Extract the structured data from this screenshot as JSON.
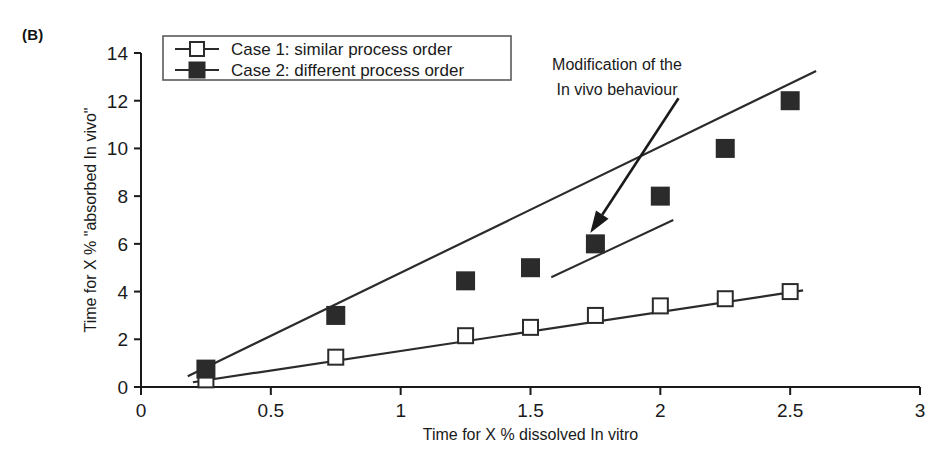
{
  "figure": {
    "panel_label": "(B)"
  },
  "chart_data": {
    "type": "line",
    "title": "",
    "subtitle": "",
    "xlabel": "Time for X % dissolved In vitro",
    "ylabel": "Time for X % \"absorbed In vivo\"",
    "xlim": [
      0,
      3
    ],
    "ylim": [
      0,
      14
    ],
    "xticks": [
      0,
      0.5,
      1,
      1.5,
      2,
      2.5,
      3
    ],
    "xtick_labels": [
      "0",
      "0.5",
      "1",
      "1.5",
      "2",
      "2.5",
      "3"
    ],
    "yticks": [
      0,
      2,
      4,
      6,
      8,
      10,
      12,
      14
    ],
    "ytick_labels": [
      "0",
      "2",
      "4",
      "6",
      "8",
      "10",
      "12",
      "14"
    ],
    "grid": false,
    "legend_position": "top-left-inside",
    "series": [
      {
        "name": "Case 1: similar process order",
        "marker": "open-square",
        "x": [
          0.25,
          0.75,
          1.25,
          1.5,
          1.75,
          2.0,
          2.25,
          2.5
        ],
        "values": [
          0.3,
          1.25,
          2.15,
          2.5,
          3.0,
          3.4,
          3.7,
          4.0
        ]
      },
      {
        "name": "Case 2: different process order",
        "marker": "filled-square",
        "x": [
          0.25,
          0.75,
          1.25,
          1.5,
          1.75,
          2.0,
          2.25,
          2.5
        ],
        "values": [
          0.75,
          3.0,
          4.45,
          5.0,
          6.0,
          8.0,
          10.0,
          12.0
        ]
      }
    ],
    "trend_lines": [
      {
        "name": "case-1-fit",
        "x": [
          0.2,
          2.55
        ],
        "y": [
          0.2,
          4.05
        ]
      },
      {
        "name": "case-2-lower-fit",
        "x": [
          0.18,
          2.6
        ],
        "y": [
          0.45,
          13.25
        ]
      },
      {
        "name": "case-2-branch-fit",
        "x": [
          1.58,
          2.05
        ],
        "y": [
          4.6,
          7.0
        ]
      }
    ],
    "annotations": [
      {
        "name": "modification-note",
        "lines": [
          "Modification of the",
          "In vivo behaviour"
        ],
        "arrow_from": {
          "x": 2.07,
          "y": 12.1
        },
        "arrow_to": {
          "x": 1.73,
          "y": 6.45
        }
      }
    ]
  },
  "legend": {
    "items": [
      {
        "label": "Case 1: similar process order",
        "marker": "open-square"
      },
      {
        "label": "Case 2: different process order",
        "marker": "filled-square"
      }
    ]
  },
  "colors": {
    "ink": "#1a1a1a",
    "series": "#2b2b2b",
    "background": "#ffffff",
    "legend_border": "#5a5a5a"
  }
}
